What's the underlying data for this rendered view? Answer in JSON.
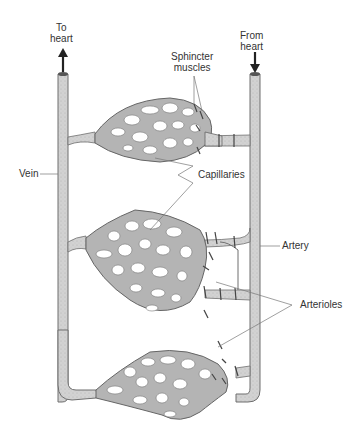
{
  "diagram": {
    "type": "anatomical-illustration",
    "colors": {
      "vessel_fill": "#cfcfcf",
      "vessel_stroke": "#6e6e6e",
      "capillary_fill": "#a9a9a9",
      "leader_line": "#777777",
      "text": "#333333",
      "background": "#ffffff"
    }
  },
  "labels": {
    "to_heart_line1": "To",
    "to_heart_line2": "heart",
    "from_heart_line1": "From",
    "from_heart_line2": "heart",
    "sphincter_line1": "Sphincter",
    "sphincter_line2": "muscles",
    "vein": "Vein",
    "capillaries": "Capillaries",
    "artery": "Artery",
    "arterioles": "Arterioles"
  },
  "arrows": {
    "to_heart": "up-arrow",
    "from_heart": "down-arrow"
  }
}
